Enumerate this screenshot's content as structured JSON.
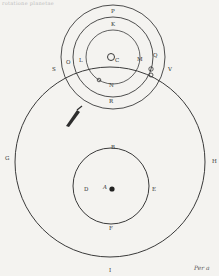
{
  "page": {
    "header_text": "rotatione planetae",
    "footer_catchword": "Per a"
  },
  "diagram": {
    "upper_system": {
      "center_label": "C",
      "labels": {
        "outer_top": "P",
        "middle_top": "K",
        "inner_left": "L",
        "inner_right": "M",
        "inner_bottom": "N",
        "outer_bottom": "R",
        "outer_left": "O",
        "right_planet": "Q"
      }
    },
    "big_circle": {
      "labels": {
        "left_intersection": "S",
        "right_intersection": "V",
        "left": "G",
        "right": "H",
        "bottom": "I"
      }
    },
    "lower_system": {
      "center_label": "A",
      "labels": {
        "top": "B",
        "left": "D",
        "right": "E",
        "bottom": "F"
      }
    },
    "colors": {
      "ink": "#333333",
      "paper": "#f4f3f0"
    }
  }
}
